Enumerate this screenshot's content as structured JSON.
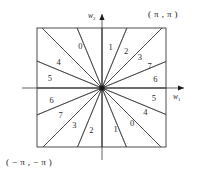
{
  "figure": {
    "title": "",
    "axes": {
      "x_label": "w",
      "x_label_sub": "1",
      "y_label": "w",
      "y_label_sub": "2"
    },
    "corners": {
      "top_right": "( π ,  π )",
      "bottom_left": "( − π ,  − π )"
    },
    "geometry": {
      "square_left": 37,
      "square_top": 28,
      "square_right": 166,
      "square_bottom": 147,
      "center_x": 102,
      "center_y": 88,
      "sector_count": 16,
      "ray_count": 16
    },
    "sectors": [
      {
        "label": "1",
        "angle_deg": 78,
        "radius": 41
      },
      {
        "label": "2",
        "angle_deg": 56,
        "radius": 43
      },
      {
        "label": "3",
        "angle_deg": 38,
        "radius": 48
      },
      {
        "label": "7",
        "angle_deg": 24,
        "radius": 52
      },
      {
        "label": "6",
        "angle_deg": 8,
        "radius": 54
      },
      {
        "label": "5",
        "angle_deg": -12,
        "radius": 53
      },
      {
        "label": "4",
        "angle_deg": -30,
        "radius": 50
      },
      {
        "label": "0",
        "angle_deg": -50,
        "radius": 47
      },
      {
        "label": "1",
        "angle_deg": -72,
        "radius": 44
      },
      {
        "label": "2",
        "angle_deg": -104,
        "radius": 44
      },
      {
        "label": "3",
        "angle_deg": -126,
        "radius": 47
      },
      {
        "label": "7",
        "angle_deg": -146,
        "radius": 50
      },
      {
        "label": "6",
        "angle_deg": -166,
        "radius": 52
      },
      {
        "label": "5",
        "angle_deg": 170,
        "radius": 53
      },
      {
        "label": "4",
        "angle_deg": 150,
        "radius": 50
      },
      {
        "label": "0",
        "angle_deg": 118,
        "radius": 46
      }
    ],
    "ray_angles_deg": [
      0,
      22.5,
      45,
      67.5,
      90,
      112.5,
      135,
      157.5,
      180,
      202.5,
      225,
      247.5,
      270,
      292.5,
      315,
      337.5
    ]
  }
}
